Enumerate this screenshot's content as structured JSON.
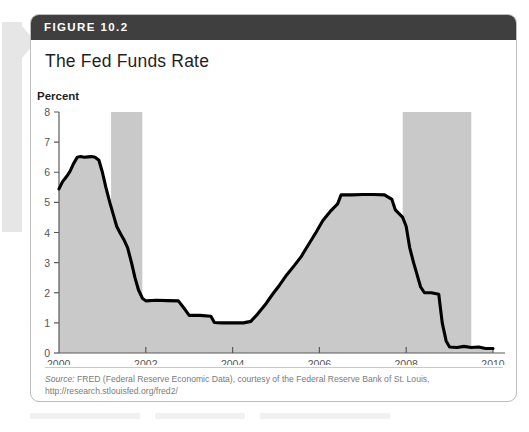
{
  "figure": {
    "number_label": "FIGURE 10.2",
    "title": "The Fed Funds Rate",
    "source_label": "Source:",
    "source_text": " FRED (Federal Reserve Economic Data), courtesy of the Federal Reserve Bank of St. Louis,",
    "source_url": "http://research.stlouisfed.org/fred2/"
  },
  "colors": {
    "header_bar": "#3f3f3f",
    "card_border": "#bdbdbd",
    "area_fill": "#c9c9c9",
    "recession_band": "#c9c9c9",
    "line": "#000000",
    "axis": "#5a5a5a",
    "tick_label": "#555555",
    "margin_bar": "#e6e6e6"
  },
  "chart_data": {
    "type": "area",
    "title": "The Fed Funds Rate",
    "xlabel": "Year",
    "ylabel": "Percent",
    "xlim": [
      2000,
      2010
    ],
    "ylim": [
      0,
      8
    ],
    "ytick_labels": [
      "0",
      "1",
      "2",
      "3",
      "4",
      "5",
      "6",
      "7",
      "8"
    ],
    "yticks": [
      0,
      1,
      2,
      3,
      4,
      5,
      6,
      7,
      8
    ],
    "xtick_labels": [
      "2000",
      "2002",
      "2004",
      "2006",
      "2008",
      "2010"
    ],
    "xticks": [
      2000,
      2002,
      2004,
      2006,
      2008,
      2010
    ],
    "grid": false,
    "legend": "none",
    "series": [
      {
        "name": "Federal Funds Rate",
        "x": [
          2000.0,
          2000.08,
          2000.17,
          2000.25,
          2000.33,
          2000.42,
          2000.5,
          2000.58,
          2000.67,
          2000.75,
          2000.83,
          2000.92,
          2001.0,
          2001.08,
          2001.17,
          2001.25,
          2001.33,
          2001.42,
          2001.5,
          2001.58,
          2001.67,
          2001.75,
          2001.83,
          2001.92,
          2002.0,
          2002.25,
          2002.5,
          2002.75,
          2002.9,
          2003.0,
          2003.25,
          2003.5,
          2003.58,
          2003.75,
          2004.0,
          2004.25,
          2004.42,
          2004.58,
          2004.75,
          2004.92,
          2005.08,
          2005.25,
          2005.42,
          2005.58,
          2005.75,
          2005.92,
          2006.08,
          2006.25,
          2006.42,
          2006.5,
          2006.75,
          2007.0,
          2007.25,
          2007.5,
          2007.67,
          2007.75,
          2007.92,
          2008.0,
          2008.08,
          2008.17,
          2008.25,
          2008.33,
          2008.42,
          2008.58,
          2008.75,
          2008.83,
          2008.92,
          2009.0,
          2009.17,
          2009.33,
          2009.5,
          2009.67,
          2009.83,
          2010.0
        ],
        "values": [
          5.45,
          5.68,
          5.85,
          6.02,
          6.27,
          6.5,
          6.52,
          6.5,
          6.51,
          6.52,
          6.5,
          6.4,
          6.0,
          5.5,
          5.0,
          4.6,
          4.2,
          3.95,
          3.75,
          3.5,
          3.0,
          2.5,
          2.1,
          1.82,
          1.73,
          1.75,
          1.74,
          1.73,
          1.45,
          1.25,
          1.25,
          1.22,
          1.01,
          1.0,
          1.0,
          1.0,
          1.05,
          1.3,
          1.6,
          1.95,
          2.25,
          2.6,
          2.9,
          3.2,
          3.6,
          4.0,
          4.4,
          4.7,
          4.95,
          5.25,
          5.25,
          5.26,
          5.26,
          5.25,
          5.1,
          4.75,
          4.5,
          4.2,
          3.5,
          3.0,
          2.6,
          2.2,
          2.0,
          2.0,
          1.95,
          1.0,
          0.4,
          0.2,
          0.18,
          0.22,
          0.18,
          0.2,
          0.15,
          0.15
        ]
      }
    ],
    "shaded_regions": [
      {
        "name": "recession-2001",
        "x_start": 2001.2,
        "x_end": 2001.92
      },
      {
        "name": "recession-2008",
        "x_start": 2007.92,
        "x_end": 2009.5
      }
    ]
  }
}
